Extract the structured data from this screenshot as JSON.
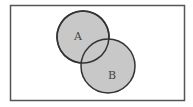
{
  "diagram": {
    "type": "venn",
    "universe": {
      "x": 10,
      "y": 5,
      "width": 174,
      "height": 95,
      "stroke": "#555555",
      "fill": "#ffffff"
    },
    "sets": [
      {
        "label": "A",
        "cx": 83,
        "cy": 37,
        "r": 26,
        "fill": "#c8c8c8",
        "stroke": "#333333",
        "label_x": 78,
        "label_y": 37
      },
      {
        "label": "B",
        "cx": 108,
        "cy": 66,
        "r": 27,
        "fill": "#c8c8c8",
        "stroke": "#333333",
        "label_x": 112,
        "label_y": 76
      }
    ]
  }
}
